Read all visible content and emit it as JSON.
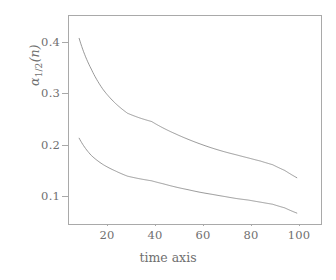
{
  "figure": {
    "background": "#ffffff",
    "frame_color": "#a9a9a9",
    "text_color": "#6f6f6f"
  },
  "axes": {
    "xlabel": "time axis",
    "ylabel_parts": {
      "symbol": "α",
      "subscript": "1/2",
      "argument": "(n)"
    },
    "ylabel_text": "α₁∕₂(n)",
    "xticks": [
      "20",
      "40",
      "60",
      "80",
      "100"
    ],
    "yticks": [
      "0.1",
      "0.2",
      "0.3",
      "0.4"
    ]
  },
  "chart_data": {
    "type": "line",
    "title": "",
    "xlabel": "time axis",
    "ylabel": "alpha_{1/2}(n)",
    "xlim": [
      5.8,
      110.0
    ],
    "ylim": [
      0.048,
      0.448
    ],
    "xticks": [
      20,
      40,
      60,
      80,
      100
    ],
    "yticks": [
      0.1,
      0.2,
      0.3,
      0.4
    ],
    "grid": false,
    "legend": "none",
    "x": [
      10,
      15,
      20,
      25,
      30,
      35,
      40,
      45,
      50,
      55,
      60,
      65,
      70,
      75,
      80,
      85,
      90,
      95,
      100
    ],
    "series": [
      {
        "name": "alpha_1(n)",
        "color": "#8c8c8c",
        "linewidth": 0.9,
        "values": [
          0.405,
          0.346,
          0.306,
          0.28,
          0.261,
          0.252,
          0.245,
          0.232,
          0.221,
          0.211,
          0.202,
          0.194,
          0.187,
          0.181,
          0.175,
          0.169,
          0.162,
          0.151,
          0.137
        ]
      },
      {
        "name": "alpha_2(n)",
        "color": "#8c8c8c",
        "linewidth": 0.9,
        "values": [
          0.213,
          0.18,
          0.162,
          0.15,
          0.14,
          0.135,
          0.131,
          0.125,
          0.119,
          0.114,
          0.109,
          0.105,
          0.101,
          0.097,
          0.094,
          0.09,
          0.086,
          0.079,
          0.069
        ]
      }
    ]
  }
}
